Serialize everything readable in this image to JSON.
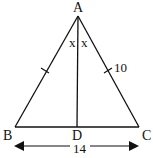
{
  "diagram": {
    "type": "isosceles-triangle",
    "vertices": {
      "A": {
        "label": "A",
        "x": 78,
        "y": 16
      },
      "B": {
        "label": "B",
        "x": 15,
        "y": 127
      },
      "C": {
        "label": "C",
        "x": 139,
        "y": 127
      },
      "D": {
        "label": "D",
        "x": 77,
        "y": 127
      }
    },
    "angle_labels": {
      "left": "x",
      "right": "x"
    },
    "side_labels": {
      "AC": "10",
      "BC": "14"
    },
    "stroke_color": "#111111"
  }
}
